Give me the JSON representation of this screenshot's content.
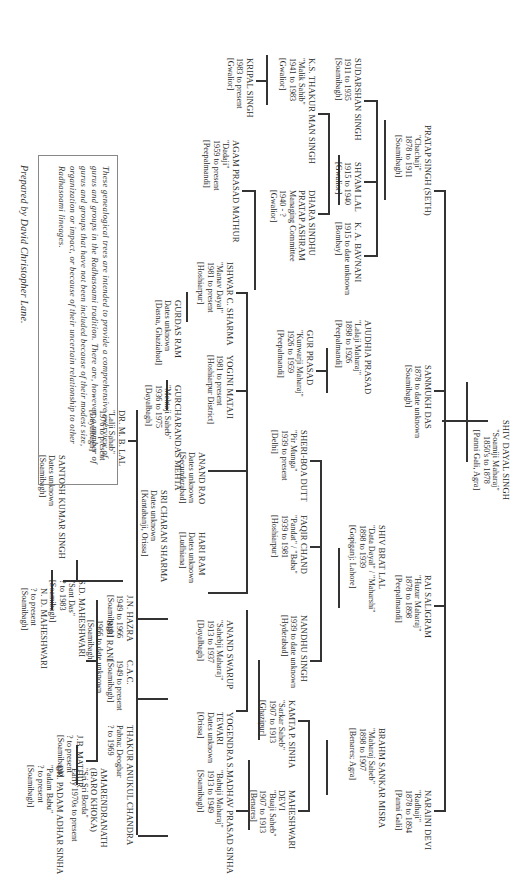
{
  "document": {
    "orientation": "rotated 90 degrees clockwise",
    "note": "These genealogical trees are intended to provide a comprehensive overview of gurus and groups in the Radhasoami tradition. There are, however, a number of gurus and groups that have not been included because of their modest size, organization or impact, or because of their uncertain relationship to other Radhasoami lineages.",
    "credit": "Prepared by David Christopher Lane."
  },
  "tree": {
    "root": {
      "name": "SHIV DAYAL SINGH",
      "title": "\"Soamiji Maharaj\"",
      "dates": "1850's to 1878",
      "place": "[Panni Gali, Agra]"
    },
    "gen1": [
      {
        "name": "PRATAP SINGH (SETH)",
        "title": "\"Chachaji\"",
        "dates": "1878 to 1911",
        "place": "[Soamibagh]"
      },
      {
        "name": "SANMUKH DAS",
        "dates": "1878 to date unknown",
        "place": "[Soamibagh]"
      },
      {
        "name": "RAI SALIGRAM",
        "title": "\"Huzur Maharaj\"",
        "dates": "1878 to 1898",
        "place": "[Peepalmandi]"
      },
      {
        "name": "NARAINI DEVI",
        "title": "\"Radhaji\"",
        "dates": "1878 to 1894",
        "place": "[Panni Gali]"
      }
    ],
    "gen2": [
      {
        "name": "SUDARSHAN SINGH",
        "dates": "1911 to 1935",
        "place": "[Soamibagh]"
      },
      {
        "name": "SHYAM LAL",
        "dates": "1915 to 1940",
        "place": "[Gwalior]"
      },
      {
        "name": "K. A. BAVNANI",
        "dates": "1915 to date unknown",
        "place": "[Bombay]"
      },
      {
        "name": "AJUDHIA PRASAD",
        "title": "\"Lalaji Maharaj\"",
        "dates": "1898 to 1926",
        "place": "[Peepalmandi]"
      },
      {
        "name": "SHIV BRAT LAL",
        "title": "\"Data Dayal\" / \"Maharshi\"",
        "dates": "1898 to 1939",
        "place": "[Gopiganj; Lahore]"
      },
      {
        "name": "BRAHM SANKAR MISRA",
        "title": "\"Maharaj Saheb\"",
        "dates": "1898 to 1907",
        "place": "[Benares; Agra]"
      }
    ],
    "gen3": [
      {
        "name": "K.S. THAKUR MAN SINGH",
        "title": "\"Malik Sahib\"",
        "dates": "1941 to 1983",
        "place": "[Gwalior]"
      },
      {
        "name": "DHARA SINDHU PRATAP ASHRAM",
        "title": "Managing Committee",
        "dates": "1940 - ?",
        "place": "[Gwalior]"
      },
      {
        "name": "GUR PRASAD",
        "title": "\"Kunwarji Maharaj\"",
        "dates": "1926 to 1959",
        "place": "[Peepalmandi]"
      },
      {
        "name": "SHERI-BOA DUTT",
        "title": "\"Pir Munga\"",
        "dates": "1939 to present",
        "place": "[Delhi]"
      },
      {
        "name": "FAQIR CHAND",
        "title": "\"Pandat\" / \"Baba\"",
        "dates": "1939 to 1981",
        "place": "[Hoshiarpur]"
      },
      {
        "name": "NANDHU SINGH",
        "dates": "1939 to date unknown",
        "place": "[Hyderabad]"
      },
      {
        "name": "KAMTA P. SINHA",
        "title": "\"Sarkar Saheb\"",
        "dates": "1907 to 1913",
        "place": "[Ghazipur]"
      },
      {
        "name": "MAHESHWARI DEVI",
        "title": "\"Buaji Saheb\"",
        "dates": "1907 to 1913",
        "place": "[Benares]"
      }
    ],
    "gen4": [
      {
        "name": "KRIPAL SINGH",
        "dates": "1983 to present",
        "place": "[Gwalior]"
      },
      {
        "name": "AGAM PRASAD MATHUR",
        "title": "\"Dadaji\"",
        "dates": "1959 to present",
        "place": "[Peepalmandi]"
      },
      {
        "name": "ISHWAR C. SHARMA",
        "title": "\"Manav Dayal\"",
        "dates": "1981 to present",
        "place": "[Hoshiarpur]"
      },
      {
        "name": "YOGINI MATAJI",
        "dates": "1981 to present",
        "place": "[Hoshiarpur District]"
      },
      {
        "name": "ANAND RAO",
        "dates": "Dates unknown",
        "place": "[Secunderabad]"
      },
      {
        "name": "HARI RAM",
        "dates": "Dates unknown",
        "place": "[Ludhiana]"
      },
      {
        "name": "ANAND SWARUP",
        "title": "\"Sahebji Maharaj\"",
        "dates": "1913 to 1937",
        "place": "[Dayalbagh]"
      },
      {
        "name": "YOGENDRA S. TEWARI",
        "dates": "Dates unknown",
        "place": "[Orissa]"
      },
      {
        "name": "MADHAV PRASAD SINHA",
        "title": "\"Babuji Maharaj\"",
        "dates": "1913 to 1949",
        "place": "[Soamibagh]"
      }
    ],
    "gen5": [
      {
        "name": "GURDAS RAM",
        "dates": "Dates unknown",
        "place": "[Dasna, Ghaziabad]"
      },
      {
        "name": "GURCHARANDAS MEHTA",
        "title": "\"Mehtaji Saheb\"",
        "dates": "1936 to 1975",
        "place": "[Dayalbagh]"
      },
      {
        "name": "SRI CHARAN SHARMA",
        "dates": "Dates unknown",
        "place": "[Kantabanji, Orissa]"
      },
      {
        "name": "J.N. HAZRA",
        "dates": "1949 to 1966",
        "place": "[Soamibagh]"
      },
      {
        "name": "C.A.C.",
        "dates": "1949 to present",
        "place": "[Soamibagh]"
      },
      {
        "name": "THAKUR ANUKUL CHANDRA",
        "dates": "? to 1969",
        "place": "Pabna; Deoghar"
      }
    ],
    "gen6": [
      {
        "name": "DR. M. B. LAL",
        "title": "\"Lalji Sahab\"",
        "dates": "1976 to present",
        "place": "[Dayalbagh]"
      },
      {
        "name": "SANTOSH KUMAR SINGH",
        "dates": "Dates unknown",
        "place": "[Soamibagh]"
      },
      {
        "name": "BIBI RANI",
        "dates": "1966 to date unknown",
        "place": "[Soamibagh]"
      },
      {
        "name": "S.D. MAHESHWARI",
        "title": "\"Sant Das\"",
        "dates": "? to 1983",
        "place": "[Soamibagh]"
      },
      {
        "name": "J.B. MATHUR",
        "dates": "? to present",
        "place": "[Soamibagh]"
      },
      {
        "name": "AMARENDRANATH (BARO KHOKA)",
        "title": "\"Sri Sri Borda\"",
        "dates": "Early 1970s to present",
        "place": ""
      },
      {
        "name": "DR. PADAM ADHAR SINHA",
        "title": "\"Padam Babu\"",
        "dates": "? to present",
        "place": "[Soamibagh]"
      }
    ],
    "gen7": [
      {
        "name": "N. D. MAHESHWARI",
        "dates": "? to present",
        "place": "[Soamibagh]"
      }
    ]
  }
}
